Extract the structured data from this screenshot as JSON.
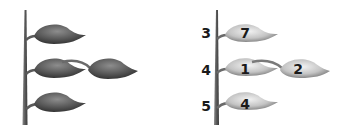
{
  "left_panel": {
    "description": "Plant stem with unlabeled leaves",
    "leaves": [
      "top",
      "middle",
      "middle-offshoot",
      "bottom"
    ]
  },
  "right_panel": {
    "node_labels": [
      "3",
      "4",
      "5"
    ],
    "leaf_labels": {
      "top": "7",
      "middle": "1",
      "middle_offshoot": "2",
      "bottom": "4"
    }
  },
  "colors": {
    "leaf_dark": "#3a3a3a",
    "leaf_light": "#8a8a8a",
    "right_leaf_dark": "#6a6a6a",
    "right_leaf_light": "#e8e8e8",
    "stem": "#6b6b6b"
  }
}
